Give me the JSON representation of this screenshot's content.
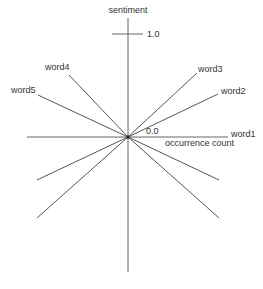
{
  "diagram": {
    "type": "radial word plot",
    "axes": {
      "y_label": "sentiment",
      "y_tick_label": "1.0",
      "x_label": "occurrence count",
      "origin_label": "0.0"
    },
    "words": [
      {
        "label": "word1"
      },
      {
        "label": "word2"
      },
      {
        "label": "word3"
      },
      {
        "label": "word4"
      },
      {
        "label": "word5"
      }
    ],
    "colors": {
      "axis": "#666666",
      "rays": "#555555",
      "text": "#333333",
      "background": "#ffffff"
    }
  }
}
